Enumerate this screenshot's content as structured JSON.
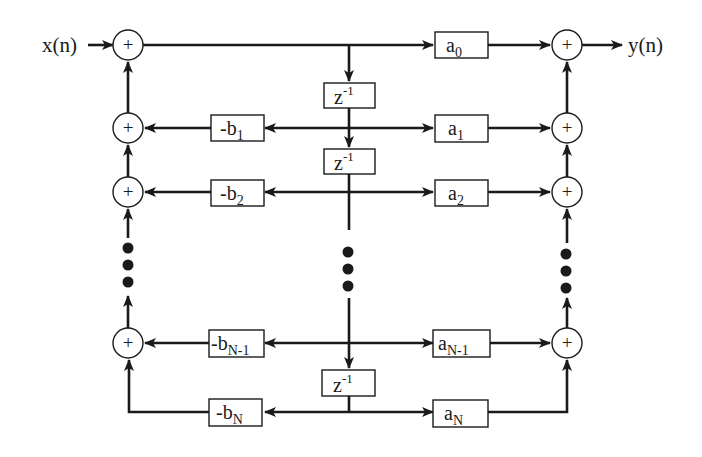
{
  "diagram": {
    "input_label": "x(n)",
    "output_label": "y(n)",
    "adder_symbol": "+",
    "delay": {
      "base": "z",
      "exponent": "-1"
    },
    "feedforward_coeffs": [
      {
        "base": "a",
        "sub": "0"
      },
      {
        "base": "a",
        "sub": "1"
      },
      {
        "base": "a",
        "sub": "2"
      },
      {
        "base": "a",
        "sub": "N-1"
      },
      {
        "base": "a",
        "sub": "N"
      }
    ],
    "feedback_coeffs": [
      {
        "base": "-b",
        "sub": "1"
      },
      {
        "base": "-b",
        "sub": "2"
      },
      {
        "base": "-b",
        "sub": "N-1"
      },
      {
        "base": "-b",
        "sub": "N"
      }
    ],
    "ellipsis": "vertical-dots",
    "colors": {
      "stroke": "#1a1a1a",
      "background": "#ffffff"
    }
  }
}
